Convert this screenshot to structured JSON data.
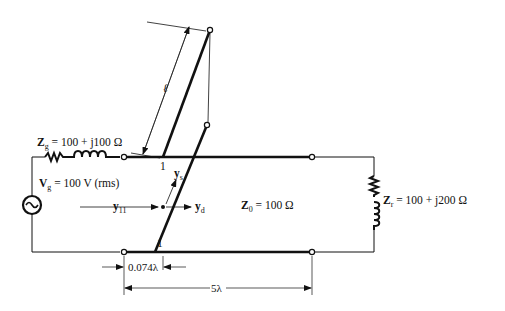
{
  "diagram": {
    "type": "transmission line with double-stub tuner",
    "source": {
      "impedance_symbol": "Z",
      "impedance_sub": "g",
      "impedance_value": "= 100 + j100 Ω",
      "voltage_symbol": "V",
      "voltage_sub": "g",
      "voltage_value": "= 100 V (rms)"
    },
    "line": {
      "z0_symbol": "Z",
      "z0_sub": "0",
      "z0_value": "= 100 Ω"
    },
    "load": {
      "symbol": "Z",
      "sub": "r",
      "value": "= 100 + j200 Ω"
    },
    "stubs": {
      "length_symbol": "ℓ",
      "stub1_label": "1",
      "stub2_label": "1"
    },
    "admittances": {
      "y11_symbol": "y",
      "y11_sub": "11",
      "ys_symbol": "y",
      "ys_sub": "s",
      "yd_symbol": "y",
      "yd_sub": "d"
    },
    "dimensions": {
      "stub_spacing": "0.074λ",
      "line_length": "5λ"
    }
  }
}
